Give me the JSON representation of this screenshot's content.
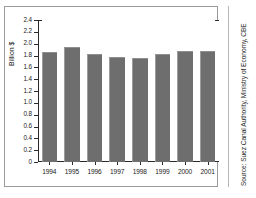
{
  "chart_data": {
    "type": "bar",
    "title": "",
    "subtitle": "",
    "xlabel": "",
    "ylabel": "Billion $",
    "categories": [
      "1994",
      "1995",
      "1996",
      "1997",
      "1998",
      "1999",
      "2000",
      "2001"
    ],
    "values": [
      1.86,
      1.94,
      1.83,
      1.78,
      1.76,
      1.82,
      1.87,
      1.87
    ],
    "series": [
      {
        "name": "Suez Canal revenues",
        "values": [
          1.86,
          1.94,
          1.83,
          1.78,
          1.76,
          1.82,
          1.87,
          1.87
        ]
      }
    ],
    "ylim": [
      0,
      2.4
    ],
    "ytick_labels": [
      "2.4",
      "2.2",
      "2.0",
      "1.8",
      "1.6",
      "1.4",
      "1.2",
      "1.0",
      "0.8",
      "0.6",
      "0.4",
      "0.2",
      "0"
    ],
    "ytick_values": [
      2.4,
      2.2,
      2.0,
      1.8,
      1.6,
      1.4,
      1.2,
      1.0,
      0.8,
      0.6,
      0.4,
      0.2,
      0
    ],
    "grid": false,
    "legend": false,
    "legend_position": "none",
    "bar_color": "#6e6e6e",
    "axis_color": "#2a2a2a"
  },
  "annotations": {
    "source_note": "Source: Suez Canal Authority, Ministry of Economy, CBE"
  }
}
